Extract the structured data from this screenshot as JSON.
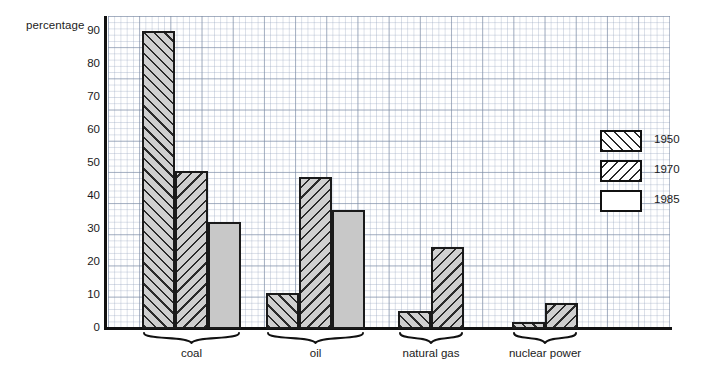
{
  "chart_data": {
    "type": "bar",
    "title": "",
    "subtitle": "",
    "ylabel": "percentage",
    "xlabel": "",
    "ylim": [
      0,
      95
    ],
    "yticks": [
      0,
      10,
      20,
      30,
      40,
      50,
      60,
      70,
      80,
      90
    ],
    "grid": true,
    "legend_position": "right",
    "categories": [
      "coal",
      "oil",
      "natural gas",
      "nuclear power"
    ],
    "series": [
      {
        "name": "1950",
        "values": [
          90.5,
          11,
          5.5,
          2
        ],
        "pattern": "diagonal-forward-hatch",
        "color": "#cfcfcf"
      },
      {
        "name": "1970",
        "values": [
          48,
          46,
          25,
          8
        ],
        "pattern": "diagonal-back-hatch",
        "color": "#cfcfcf"
      },
      {
        "name": "1985",
        "values": [
          32.5,
          36,
          null,
          null
        ],
        "pattern": "solid",
        "color": "#c8c8c8"
      }
    ]
  },
  "axis": {
    "y_title": "percentage",
    "ticks": [
      "90",
      "80",
      "70",
      "60",
      "50",
      "40",
      "30",
      "20",
      "10",
      "0"
    ]
  },
  "groups": [
    {
      "label": "coal"
    },
    {
      "label": "oil"
    },
    {
      "label": "natural gas"
    },
    {
      "label": "nuclear power"
    }
  ],
  "legend": {
    "items": [
      {
        "label": "1950",
        "swatch": "hatch-forward-swatch"
      },
      {
        "label": "1970",
        "swatch": "hatch-back-swatch"
      },
      {
        "label": "1985",
        "swatch": "solid-white-swatch"
      }
    ]
  }
}
